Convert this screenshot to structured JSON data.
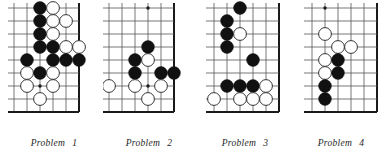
{
  "figure": {
    "type": "go-problem-set",
    "panel_count": 4,
    "background_color": "#ffffff",
    "line_color": "#555555",
    "edge_color": "#1a1a1a",
    "black_stone_color": "#111111",
    "white_stone_color": "#ffffff",
    "white_stone_border": "#333333"
  },
  "board_geometry": {
    "cols": 6,
    "rows": 9,
    "cell": 13,
    "stone_radius": 6.4,
    "note": "corner/edge excerpt: right column is the board edge"
  },
  "problems": [
    {
      "id": "problem-1",
      "caption_word": "Problem",
      "caption_number": "1",
      "panel_left": 8,
      "panel_width": 92,
      "board_left": 14,
      "board_top": 8,
      "grid": {
        "cols": 6,
        "rows": 9,
        "cell": 13
      },
      "edges": {
        "right": true,
        "bottom": true
      },
      "star_points": [
        {
          "col": 2,
          "row": 6
        }
      ],
      "stones": [
        {
          "color": "black",
          "col": 2,
          "row": 0
        },
        {
          "color": "white",
          "col": 3,
          "row": 0
        },
        {
          "color": "black",
          "col": 2,
          "row": 1
        },
        {
          "color": "white",
          "col": 3,
          "row": 1
        },
        {
          "color": "white",
          "col": 4,
          "row": 1
        },
        {
          "color": "black",
          "col": 2,
          "row": 2
        },
        {
          "color": "white",
          "col": 3,
          "row": 2
        },
        {
          "color": "black",
          "col": 2,
          "row": 3
        },
        {
          "color": "black",
          "col": 3,
          "row": 3
        },
        {
          "color": "white",
          "col": 4,
          "row": 3
        },
        {
          "color": "white",
          "col": 5,
          "row": 3
        },
        {
          "color": "black",
          "col": 1,
          "row": 4
        },
        {
          "color": "black",
          "col": 3,
          "row": 4
        },
        {
          "color": "black",
          "col": 4,
          "row": 4
        },
        {
          "color": "black",
          "col": 5,
          "row": 4
        },
        {
          "color": "white",
          "col": 1,
          "row": 5
        },
        {
          "color": "black",
          "col": 2,
          "row": 5
        },
        {
          "color": "white",
          "col": 3,
          "row": 5
        },
        {
          "color": "white",
          "col": 1,
          "row": 6
        },
        {
          "color": "white",
          "col": 3,
          "row": 6
        },
        {
          "color": "white",
          "col": 2,
          "row": 7
        }
      ]
    },
    {
      "id": "problem-2",
      "caption_word": "Problem",
      "caption_number": "2",
      "panel_left": 103,
      "panel_width": 92,
      "board_left": 109,
      "board_top": 8,
      "grid": {
        "cols": 6,
        "rows": 9,
        "cell": 13
      },
      "edges": {
        "right": true,
        "bottom": true
      },
      "star_points": [
        {
          "col": 3,
          "row": 0
        },
        {
          "col": 3,
          "row": 6
        }
      ],
      "stones": [
        {
          "color": "black",
          "col": 3,
          "row": 3
        },
        {
          "color": "black",
          "col": 2,
          "row": 4
        },
        {
          "color": "white",
          "col": 3,
          "row": 4
        },
        {
          "color": "black",
          "col": 2,
          "row": 5
        },
        {
          "color": "black",
          "col": 4,
          "row": 5
        },
        {
          "color": "black",
          "col": 5,
          "row": 5
        },
        {
          "color": "white",
          "col": 0,
          "row": 6
        },
        {
          "color": "white",
          "col": 2,
          "row": 6
        },
        {
          "color": "white",
          "col": 4,
          "row": 6
        },
        {
          "color": "white",
          "col": 3,
          "row": 7
        }
      ]
    },
    {
      "id": "problem-3",
      "caption_word": "Problem",
      "caption_number": "3",
      "panel_left": 199,
      "panel_width": 92,
      "board_left": 214,
      "board_top": 8,
      "grid": {
        "cols": 6,
        "rows": 9,
        "cell": 13
      },
      "edges": {
        "right": true,
        "bottom": true
      },
      "star_points": [],
      "stones": [
        {
          "color": "black",
          "col": 2,
          "row": 0
        },
        {
          "color": "black",
          "col": 1,
          "row": 1
        },
        {
          "color": "black",
          "col": 1,
          "row": 2
        },
        {
          "color": "white",
          "col": 2,
          "row": 2
        },
        {
          "color": "black",
          "col": 1,
          "row": 3
        },
        {
          "color": "black",
          "col": 3,
          "row": 4
        },
        {
          "color": "black",
          "col": 1,
          "row": 6
        },
        {
          "color": "black",
          "col": 2,
          "row": 6
        },
        {
          "color": "black",
          "col": 3,
          "row": 6
        },
        {
          "color": "white",
          "col": 4,
          "row": 6
        },
        {
          "color": "white",
          "col": 0,
          "row": 7
        },
        {
          "color": "white",
          "col": 2,
          "row": 7
        },
        {
          "color": "white",
          "col": 3,
          "row": 7
        },
        {
          "color": "white",
          "col": 4,
          "row": 7
        }
      ]
    },
    {
      "id": "problem-4",
      "caption_word": "Problem",
      "caption_number": "4",
      "panel_left": 295,
      "panel_width": 92,
      "board_left": 312,
      "board_top": 8,
      "grid": {
        "cols": 6,
        "rows": 9,
        "cell": 13
      },
      "edges": {
        "right": true,
        "bottom": true
      },
      "star_points": [
        {
          "col": 1,
          "row": 0
        }
      ],
      "stones": [
        {
          "color": "white",
          "col": 1,
          "row": 2
        },
        {
          "color": "white",
          "col": 2,
          "row": 3
        },
        {
          "color": "white",
          "col": 3,
          "row": 3
        },
        {
          "color": "white",
          "col": 1,
          "row": 4
        },
        {
          "color": "black",
          "col": 2,
          "row": 4
        },
        {
          "color": "white",
          "col": 1,
          "row": 5
        },
        {
          "color": "black",
          "col": 2,
          "row": 5
        },
        {
          "color": "black",
          "col": 1,
          "row": 6
        },
        {
          "color": "black",
          "col": 1,
          "row": 7
        }
      ]
    }
  ]
}
